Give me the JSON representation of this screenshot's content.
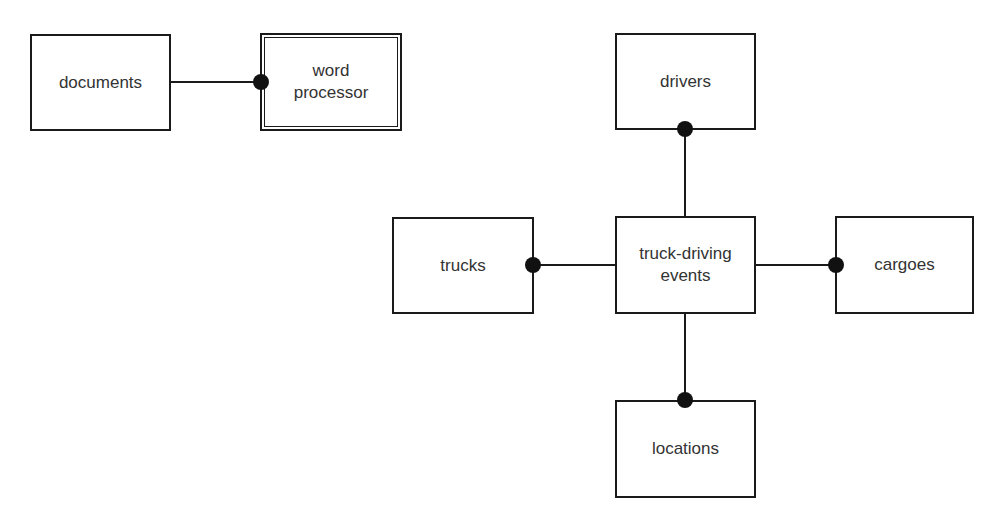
{
  "diagram": {
    "type": "entity-relationship",
    "entities": {
      "documents": "documents",
      "word_processor": "word processor",
      "drivers": "drivers",
      "trucks": "trucks",
      "truck_driving_events": "truck-driving events",
      "cargoes": "cargoes",
      "locations": "locations"
    },
    "relationships": [
      {
        "from": "documents",
        "to": "word_processor",
        "dot_end": "word_processor"
      },
      {
        "from": "truck_driving_events",
        "to": "drivers",
        "dot_end": "drivers"
      },
      {
        "from": "truck_driving_events",
        "to": "trucks",
        "dot_end": "trucks"
      },
      {
        "from": "truck_driving_events",
        "to": "cargoes",
        "dot_end": "cargoes"
      },
      {
        "from": "truck_driving_events",
        "to": "locations",
        "dot_end": "locations"
      }
    ],
    "double_bordered": [
      "word_processor"
    ]
  }
}
